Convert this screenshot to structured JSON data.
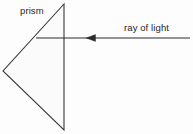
{
  "figure": {
    "width": 193,
    "height": 134,
    "background_color": "#fdfdfd",
    "stroke_color": "#3a3a3a",
    "text_color": "#262626",
    "prism_fill": "#fbfbfb"
  },
  "labels": {
    "prism": "prism",
    "ray_of_light": "ray of light"
  },
  "shapes": {
    "prism": {
      "name": "prism-triangle",
      "type": "triangle",
      "points": "64,4 3,71 64,130",
      "description": "Triangular prism pointing left, vertical face on the right"
    },
    "ray": {
      "name": "ray-of-light-arrow",
      "type": "arrow",
      "direction": "left",
      "start_x": 190,
      "end_x": 36,
      "y": 38,
      "arrowhead_x": 86,
      "arrowhead_width": 9,
      "arrowhead_height": 7
    }
  }
}
